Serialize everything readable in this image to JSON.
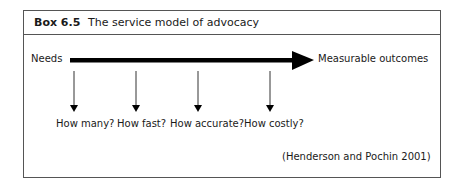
{
  "box": {
    "label": "Box 6.5",
    "title": "The service model of advocacy"
  },
  "diagram": {
    "start_label": "Needs",
    "end_label": "Measurable outcomes",
    "questions": [
      "How many?",
      "How fast?",
      "How accurate?",
      "How costly?"
    ]
  },
  "citation": "(Henderson and Pochin 2001)"
}
